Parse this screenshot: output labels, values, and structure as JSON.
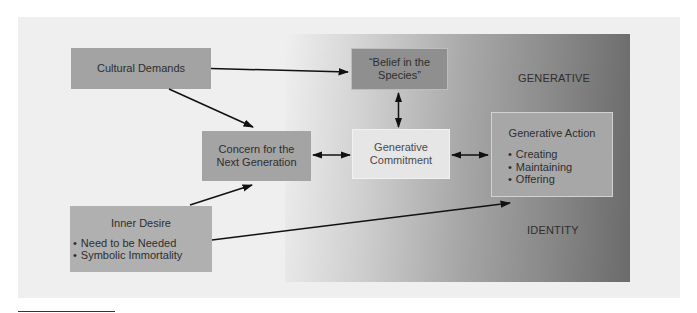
{
  "diagram": {
    "nodes": {
      "cultural_demands": {
        "title": "Cultural Demands"
      },
      "concern": {
        "line1": "Concern for the",
        "line2": "Next Generation"
      },
      "inner_desire": {
        "title": "Inner Desire",
        "bullets": [
          "Need to be Needed",
          "Symbolic Immortality"
        ]
      },
      "belief": {
        "line1": "“Belief in the",
        "line2": "Species”"
      },
      "commitment": {
        "line1": "Generative",
        "line2": "Commitment"
      },
      "action": {
        "title": "Generative Action",
        "bullets": [
          "Creating",
          "Maintaining",
          "Offering"
        ]
      }
    },
    "labels": {
      "generative": "GENERATIVE",
      "identity": "IDENTITY"
    },
    "edges": [
      {
        "from": "cultural_demands",
        "to": "belief",
        "type": "directed"
      },
      {
        "from": "cultural_demands",
        "to": "concern",
        "type": "directed"
      },
      {
        "from": "inner_desire",
        "to": "concern",
        "type": "directed"
      },
      {
        "from": "inner_desire",
        "to": "action",
        "type": "directed"
      },
      {
        "from": "concern",
        "to": "commitment",
        "type": "bidirectional"
      },
      {
        "from": "belief",
        "to": "commitment",
        "type": "bidirectional"
      },
      {
        "from": "commitment",
        "to": "action",
        "type": "bidirectional"
      }
    ]
  }
}
